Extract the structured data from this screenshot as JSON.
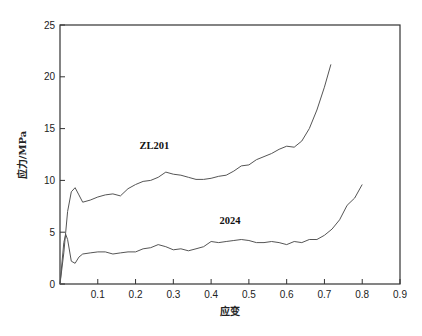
{
  "chart_data": {
    "type": "line",
    "title": "",
    "xlabel": "应变",
    "ylabel": "应力/MPa",
    "xlim": [
      0,
      0.9
    ],
    "ylim": [
      0,
      25
    ],
    "grid": false,
    "legend": "none (inline labels)",
    "x_ticks": [
      "0.1",
      "0.2",
      "0.3",
      "0.4",
      "0.5",
      "0.6",
      "0.7",
      "0.8",
      "0.9"
    ],
    "y_ticks": [
      "0",
      "5",
      "10",
      "15",
      "20",
      "25"
    ],
    "series": [
      {
        "name": "ZL201",
        "label_pos": [
          0.25,
          13
        ],
        "x": [
          0,
          0.01,
          0.02,
          0.03,
          0.04,
          0.05,
          0.06,
          0.08,
          0.1,
          0.12,
          0.14,
          0.16,
          0.18,
          0.2,
          0.22,
          0.24,
          0.26,
          0.28,
          0.3,
          0.32,
          0.34,
          0.36,
          0.38,
          0.4,
          0.42,
          0.44,
          0.46,
          0.48,
          0.5,
          0.52,
          0.54,
          0.56,
          0.58,
          0.6,
          0.62,
          0.64,
          0.66,
          0.68,
          0.7,
          0.717
        ],
        "values": [
          0,
          3,
          7,
          8.9,
          9.3,
          8.6,
          7.9,
          8.1,
          8.4,
          8.6,
          8.7,
          8.5,
          9.2,
          9.6,
          9.9,
          10.0,
          10.3,
          10.8,
          10.6,
          10.5,
          10.3,
          10.1,
          10.1,
          10.2,
          10.4,
          10.5,
          10.9,
          11.4,
          11.5,
          12.0,
          12.3,
          12.6,
          13.0,
          13.3,
          13.2,
          13.8,
          15.0,
          16.8,
          19.0,
          21.2
        ]
      },
      {
        "name": "2024",
        "label_pos": [
          0.45,
          5.8
        ],
        "x": [
          0,
          0.01,
          0.015,
          0.02,
          0.03,
          0.04,
          0.05,
          0.06,
          0.08,
          0.1,
          0.12,
          0.14,
          0.16,
          0.18,
          0.2,
          0.22,
          0.24,
          0.26,
          0.28,
          0.3,
          0.32,
          0.34,
          0.36,
          0.38,
          0.4,
          0.42,
          0.44,
          0.46,
          0.48,
          0.5,
          0.52,
          0.54,
          0.56,
          0.58,
          0.6,
          0.62,
          0.64,
          0.66,
          0.68,
          0.7,
          0.72,
          0.74,
          0.76,
          0.78,
          0.8
        ],
        "values": [
          0,
          4.0,
          4.8,
          4.3,
          2.2,
          2.0,
          2.6,
          2.9,
          3.0,
          3.1,
          3.1,
          2.9,
          3.0,
          3.1,
          3.1,
          3.4,
          3.5,
          3.8,
          3.6,
          3.3,
          3.4,
          3.2,
          3.4,
          3.6,
          4.1,
          4.0,
          4.1,
          4.2,
          4.3,
          4.2,
          4.0,
          4.0,
          4.1,
          4.0,
          3.8,
          4.1,
          4.0,
          4.3,
          4.3,
          4.7,
          5.3,
          6.2,
          7.6,
          8.3,
          9.6
        ]
      }
    ],
    "colors": {
      "axis": "#333333",
      "line": "#555555",
      "text": "#222222"
    }
  }
}
